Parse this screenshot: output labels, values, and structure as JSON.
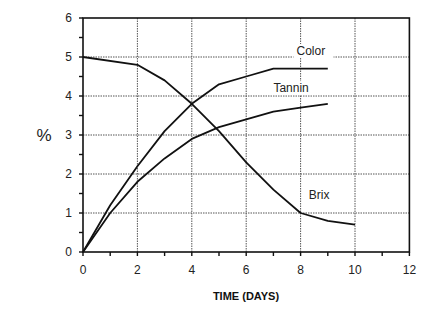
{
  "chart_data": {
    "type": "line",
    "title": "",
    "xlabel": "TIME (DAYS)",
    "ylabel": "%",
    "xlim": [
      0,
      12
    ],
    "ylim": [
      0,
      6
    ],
    "x_ticks": [
      0,
      2,
      4,
      6,
      8,
      10,
      12
    ],
    "y_ticks": [
      0,
      1,
      2,
      3,
      4,
      5,
      6
    ],
    "grid": true,
    "legend_position": "inline labels",
    "series": [
      {
        "name": "Brix",
        "x": [
          0,
          2,
          3,
          4,
          5,
          6,
          7,
          8,
          9,
          10
        ],
        "values": [
          5.0,
          4.8,
          4.4,
          3.8,
          3.1,
          2.3,
          1.6,
          1.0,
          0.8,
          0.7
        ],
        "label_pos": [
          8.3,
          1.35
        ]
      },
      {
        "name": "Color",
        "x": [
          0,
          1,
          2,
          3,
          4,
          5,
          6,
          7,
          8,
          9
        ],
        "values": [
          0,
          1.2,
          2.2,
          3.1,
          3.8,
          4.3,
          4.5,
          4.7,
          4.7,
          4.7
        ],
        "label_pos": [
          7.85,
          5.05
        ]
      },
      {
        "name": "Tannin",
        "x": [
          0,
          1,
          2,
          3,
          4,
          5,
          6,
          7,
          8,
          9
        ],
        "values": [
          0,
          1.0,
          1.8,
          2.4,
          2.9,
          3.2,
          3.4,
          3.6,
          3.7,
          3.8
        ],
        "label_pos": [
          7.0,
          4.1
        ]
      }
    ]
  },
  "colors": {
    "line": "#111111",
    "grid": "#555555",
    "background": "#ffffff"
  }
}
